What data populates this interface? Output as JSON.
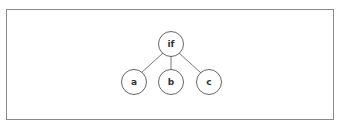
{
  "diagram": {
    "type": "tree",
    "root": {
      "label": "if"
    },
    "children": [
      {
        "label": "a"
      },
      {
        "label": "b"
      },
      {
        "label": "c"
      }
    ],
    "colors": {
      "stroke": "#555555",
      "frame": "#8a8a8a",
      "text": "#333333",
      "background": "#ffffff"
    }
  }
}
